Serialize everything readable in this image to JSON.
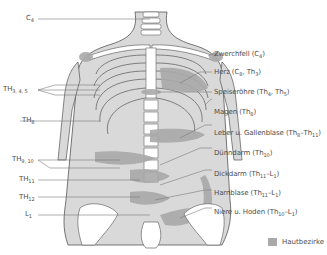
{
  "figure": {
    "colors": {
      "skin_zone": "#a9a9a9",
      "body_fill": "#d9d9d9",
      "outline": "#555555",
      "bone": "#ffffff",
      "leader_line": "#7a7a7a"
    }
  },
  "left_labels": [
    {
      "id": "c4",
      "base": "C",
      "sub": "4"
    },
    {
      "id": "th345",
      "base": "TH",
      "sub": "3, 4, 5"
    },
    {
      "id": "th8",
      "base": "TH",
      "sub": "8"
    },
    {
      "id": "th910",
      "base": "TH",
      "sub": "9, 10"
    },
    {
      "id": "th11",
      "base": "TH",
      "sub": "11"
    },
    {
      "id": "th12",
      "base": "TH",
      "sub": "12"
    },
    {
      "id": "l1",
      "base": "L",
      "sub": "1"
    }
  ],
  "right_labels": [
    {
      "id": "zwerchfell",
      "organ": "Zwerchfell",
      "segments": [
        {
          "base": "C",
          "sub": "4"
        }
      ]
    },
    {
      "id": "herz",
      "organ": "Herz",
      "segments": [
        {
          "base": "C",
          "sub": "8"
        },
        {
          "base": "Th",
          "sub": "3"
        }
      ]
    },
    {
      "id": "speiseroehre",
      "organ": "Speiseröhre",
      "segments": [
        {
          "base": "Th",
          "sub": "4"
        },
        {
          "base": "Th",
          "sub": "5"
        }
      ]
    },
    {
      "id": "magen",
      "organ": "Magen",
      "segments": [
        {
          "base": "Th",
          "sub": "8"
        }
      ]
    },
    {
      "id": "leber",
      "organ": "Leber u. Gallenblase",
      "range": [
        {
          "base": "Th",
          "sub": "8"
        },
        {
          "base": "Th",
          "sub": "11"
        }
      ]
    },
    {
      "id": "duenndarm",
      "organ": "Dünndarm",
      "segments": [
        {
          "base": "Th",
          "sub": "10"
        }
      ]
    },
    {
      "id": "dickdarm",
      "organ": "Dickdarm",
      "range": [
        {
          "base": "Th",
          "sub": "11"
        },
        {
          "base": "L",
          "sub": "1"
        }
      ]
    },
    {
      "id": "harnblase",
      "organ": "Harnblase",
      "range": [
        {
          "base": "Th",
          "sub": "11"
        },
        {
          "base": "L",
          "sub": "1"
        }
      ]
    },
    {
      "id": "niere",
      "organ": "Niere u. Hoden",
      "range": [
        {
          "base": "Th",
          "sub": "10"
        },
        {
          "base": "L",
          "sub": "1"
        }
      ]
    }
  ],
  "legend": {
    "label": "Hautbezirke",
    "swatch_color": "#a9a9a9"
  }
}
